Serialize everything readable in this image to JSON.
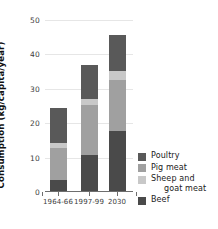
{
  "chart_data": {
    "type": "bar",
    "subtype": "stacked-vertical",
    "title": "",
    "subtitle": "",
    "xlabel": "",
    "ylabel": "Consumption (kg/capita/year)",
    "categories": [
      "1964-66",
      "1997-99",
      "2030"
    ],
    "ylim": [
      0,
      50
    ],
    "yticks": [
      0,
      10,
      20,
      30,
      40,
      50
    ],
    "ytick_labels": [
      "0",
      "10",
      "20",
      "30",
      "40",
      "50"
    ],
    "grid": true,
    "grid_axis": "y",
    "legend_position": "right",
    "stack_order_bottom_to_top": [
      "Beef",
      "Pig meat",
      "Sheep and goat meat",
      "Poultry"
    ],
    "series": [
      {
        "name": "Beef",
        "color": "#4a4a4a",
        "values": [
          3.2,
          10.4,
          17.5
        ]
      },
      {
        "name": "Pig meat",
        "color": "#a0a0a0",
        "values": [
          9.3,
          14.6,
          14.8
        ]
      },
      {
        "name": "Sheep and goat meat",
        "color": "#c8c8c8",
        "values": [
          1.5,
          1.7,
          2.7
        ]
      },
      {
        "name": "Poultry",
        "color": "#595959",
        "values": [
          10.0,
          9.8,
          10.5
        ]
      }
    ],
    "totals": [
      24.0,
      36.5,
      45.5
    ]
  },
  "axis": {
    "y_label": "Consumption (kg/capita/year)",
    "y_ticks": [
      "50",
      "40",
      "30",
      "20",
      "10",
      "0"
    ],
    "x_ticks": [
      "1964-66",
      "1997-99",
      "2030"
    ]
  },
  "legend": {
    "items": [
      {
        "label": "Poultry",
        "label_line2": "",
        "color": "#595959"
      },
      {
        "label": "Pig meat",
        "label_line2": "",
        "color": "#a0a0a0"
      },
      {
        "label": "Sheep and",
        "label_line2": "goat meat",
        "color": "#c8c8c8"
      },
      {
        "label": "Beef",
        "label_line2": "",
        "color": "#4a4a4a"
      }
    ]
  },
  "colors": {
    "poultry": "#595959",
    "pig_meat": "#a0a0a0",
    "sheep_goat_meat": "#c8c8c8",
    "beef": "#4a4a4a",
    "grid": "#e6e6e6",
    "axis": "#6e6e6e",
    "background": "#ffffff"
  }
}
